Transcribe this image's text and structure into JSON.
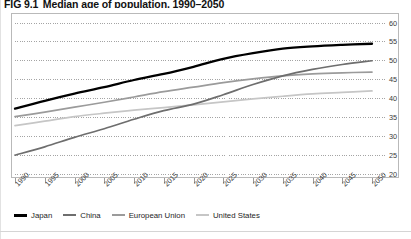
{
  "title": {
    "figure_number": "FIG 9.1",
    "text": "Median age of population, 1990–2050"
  },
  "chart_data": {
    "type": "line",
    "title": "Median age of population, 1990–2050",
    "xlabel": "",
    "ylabel": "",
    "ylim": [
      20,
      60
    ],
    "yticks": [
      20,
      25,
      30,
      35,
      40,
      45,
      50,
      55,
      60
    ],
    "ytick_labels": [
      "20",
      "25",
      "30",
      "35",
      "40",
      "45",
      "50",
      "55",
      "60"
    ],
    "y_axis_position": "right",
    "grid": true,
    "grid_style": "dotted",
    "legend_position": "bottom-left",
    "x": [
      1990,
      1995,
      2000,
      2005,
      2010,
      2015,
      2020,
      2025,
      2030,
      2035,
      2040,
      2045,
      2050
    ],
    "xtick_labels": [
      "1990",
      "1995",
      "2000",
      "2005",
      "2010",
      "2015",
      "2020",
      "2025",
      "2030",
      "2035",
      "2040",
      "2045",
      "2050"
    ],
    "series": [
      {
        "name": "Japan",
        "color": "#000000",
        "width": 2.3,
        "values": [
          37.3,
          39.4,
          41.3,
          43.0,
          44.9,
          46.5,
          48.4,
          50.5,
          52.0,
          53.2,
          53.8,
          54.2,
          54.5
        ]
      },
      {
        "name": "China",
        "color": "#6e6e6e",
        "width": 1.7,
        "values": [
          25.0,
          27.2,
          29.7,
          32.0,
          34.5,
          36.8,
          38.5,
          41.0,
          43.7,
          46.0,
          47.7,
          49.0,
          50.0
        ]
      },
      {
        "name": "European Union",
        "color": "#9b9b9b",
        "width": 1.7,
        "values": [
          35.2,
          36.4,
          37.7,
          39.0,
          40.4,
          41.8,
          43.0,
          44.2,
          45.2,
          46.0,
          46.5,
          46.8,
          47.0
        ]
      },
      {
        "name": "United States",
        "color": "#c6c6c6",
        "width": 1.7,
        "values": [
          32.8,
          34.0,
          35.2,
          36.1,
          36.9,
          37.6,
          38.3,
          39.1,
          39.9,
          40.6,
          41.2,
          41.6,
          42.0
        ]
      }
    ]
  },
  "legend": [
    {
      "label": "Japan",
      "color": "#000000",
      "thickness": 3
    },
    {
      "label": "China",
      "color": "#6e6e6e",
      "thickness": 2.4
    },
    {
      "label": "European Union",
      "color": "#9b9b9b",
      "thickness": 2.2
    },
    {
      "label": "United States",
      "color": "#c6c6c6",
      "thickness": 2.2
    }
  ],
  "colors": {
    "frame": "#b9b9b9",
    "grid": "#8d8d8d",
    "tick_text": "#3a3a3a"
  }
}
